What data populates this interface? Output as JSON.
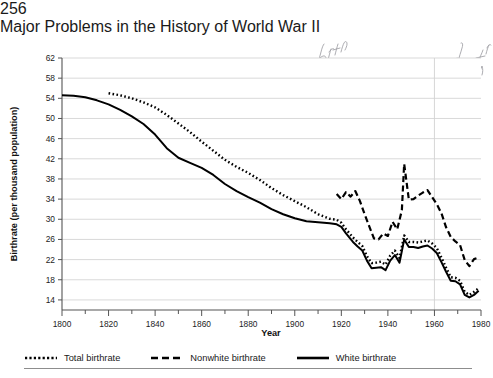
{
  "page": {
    "number": "256",
    "running_head": "Major Problems in the History of World War II",
    "annotation_text": "birth rate war especially by nonwhite"
  },
  "legend": {
    "items": [
      {
        "label": "Total birthrate",
        "style": "dotted",
        "swatch": "dotted-line-icon"
      },
      {
        "label": "Nonwhite birthrate",
        "style": "dashed",
        "swatch": "dashed-line-icon"
      },
      {
        "label": "White birthrate",
        "style": "solid",
        "swatch": "solid-line-icon"
      }
    ]
  },
  "chart_data": {
    "type": "line",
    "title": "",
    "xlabel": "Year",
    "ylabel": "Birthrate (per thousand population)",
    "xlim": [
      1800,
      1980
    ],
    "ylim": [
      12,
      62
    ],
    "xticks": [
      1800,
      1820,
      1840,
      1860,
      1880,
      1900,
      1920,
      1940,
      1960,
      1980
    ],
    "xtick_labels": [
      "1800",
      "1820",
      "1840",
      "1860",
      "1880",
      "1900",
      "1920",
      "1940",
      "1960",
      "1980"
    ],
    "xminor_step": 10,
    "yticks": [
      14,
      18,
      22,
      26,
      30,
      34,
      38,
      42,
      46,
      50,
      54,
      58,
      62
    ],
    "ytick_labels": [
      "14",
      "18",
      "22",
      "26",
      "30",
      "34",
      "38",
      "42",
      "46",
      "50",
      "54",
      "58",
      "62"
    ],
    "grid": "horizontal",
    "legend_position": "below",
    "series": [
      {
        "name": "Total birthrate",
        "style": "dotted",
        "color": "#000000",
        "x": [
          1820,
          1825,
          1830,
          1835,
          1840,
          1845,
          1850,
          1855,
          1860,
          1865,
          1870,
          1875,
          1880,
          1885,
          1890,
          1895,
          1900,
          1905,
          1910,
          1915,
          1918,
          1920,
          1922,
          1925,
          1927,
          1929,
          1931,
          1933,
          1935,
          1937,
          1939,
          1941,
          1943,
          1945,
          1947,
          1949,
          1951,
          1953,
          1955,
          1957,
          1959,
          1961,
          1963,
          1965,
          1967,
          1969,
          1971,
          1973,
          1975,
          1977,
          1979
        ],
        "y": [
          55.0,
          54.6,
          54.0,
          53.2,
          52.2,
          50.7,
          49.0,
          47.3,
          45.4,
          43.6,
          41.8,
          40.4,
          39.2,
          37.8,
          36.2,
          34.8,
          33.6,
          32.4,
          31.0,
          30.1,
          29.9,
          29.3,
          28.0,
          26.4,
          25.5,
          24.7,
          22.7,
          21.3,
          21.4,
          21.6,
          21.0,
          22.8,
          23.8,
          22.3,
          26.8,
          25.5,
          25.5,
          25.4,
          25.6,
          25.8,
          25.2,
          24.3,
          22.4,
          20.4,
          18.5,
          18.4,
          17.8,
          15.6,
          15.0,
          15.6,
          16.3
        ]
      },
      {
        "name": "Nonwhite birthrate",
        "style": "dashed",
        "color": "#000000",
        "x": [
          1918,
          1920,
          1922,
          1924,
          1926,
          1928,
          1930,
          1932,
          1934,
          1936,
          1938,
          1940,
          1942,
          1944,
          1946,
          1947,
          1949,
          1951,
          1953,
          1955,
          1957,
          1959,
          1961,
          1963,
          1965,
          1967,
          1969,
          1971,
          1973,
          1975,
          1977,
          1979
        ],
        "y": [
          35.0,
          34.0,
          35.4,
          34.5,
          35.6,
          33.6,
          31.0,
          28.6,
          26.2,
          26.0,
          27.2,
          26.7,
          29.5,
          28.0,
          31.8,
          41.0,
          33.9,
          34.0,
          34.7,
          35.3,
          35.8,
          34.4,
          33.0,
          31.2,
          28.4,
          26.5,
          25.6,
          24.9,
          21.9,
          20.7,
          22.1,
          22.4
        ]
      },
      {
        "name": "White birthrate",
        "style": "solid",
        "color": "#000000",
        "x": [
          1800,
          1805,
          1810,
          1815,
          1820,
          1825,
          1830,
          1835,
          1840,
          1845,
          1850,
          1855,
          1860,
          1865,
          1870,
          1875,
          1880,
          1885,
          1890,
          1895,
          1900,
          1905,
          1910,
          1915,
          1918,
          1920,
          1922,
          1925,
          1927,
          1929,
          1931,
          1933,
          1935,
          1937,
          1939,
          1941,
          1943,
          1945,
          1947,
          1949,
          1951,
          1953,
          1955,
          1957,
          1959,
          1961,
          1963,
          1965,
          1967,
          1969,
          1971,
          1973,
          1975,
          1977,
          1979
        ],
        "y": [
          54.6,
          54.5,
          54.2,
          53.6,
          52.8,
          51.7,
          50.4,
          48.9,
          46.8,
          44.1,
          42.2,
          41.2,
          40.2,
          38.8,
          37.0,
          35.6,
          34.4,
          33.3,
          32.0,
          31.0,
          30.2,
          29.6,
          29.4,
          29.2,
          29.0,
          28.5,
          27.2,
          25.5,
          24.6,
          23.8,
          21.8,
          20.3,
          20.4,
          20.5,
          19.9,
          21.8,
          22.9,
          21.4,
          26.0,
          24.5,
          24.5,
          24.3,
          24.6,
          24.8,
          24.2,
          23.3,
          21.5,
          19.6,
          17.8,
          17.7,
          17.1,
          15.0,
          14.5,
          15.0,
          15.8
        ]
      }
    ],
    "markers": {
      "vertical_reference_year": 1960
    }
  }
}
